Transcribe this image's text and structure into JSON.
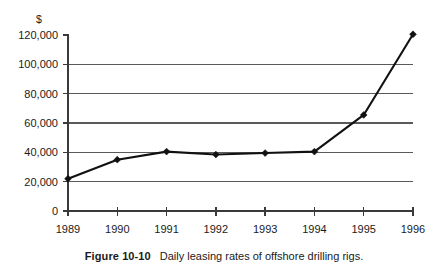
{
  "caption": {
    "number": "Figure 10-10",
    "text": "Daily leasing rates of offshore drilling rigs."
  },
  "chart_data": {
    "type": "line",
    "title": "",
    "xlabel": "",
    "ylabel": "",
    "unit_label": "$",
    "categories": [
      "1989",
      "1990",
      "1991",
      "1992",
      "1993",
      "1994",
      "1995",
      "1996"
    ],
    "values": [
      22000,
      35000,
      40500,
      38500,
      39500,
      40500,
      65500,
      120500
    ],
    "series": [
      {
        "name": "Daily leasing rate",
        "values": [
          22000,
          35000,
          40500,
          38500,
          39500,
          40500,
          65500,
          120500
        ]
      }
    ],
    "ylim": [
      0,
      120000
    ],
    "yticks": [
      0,
      20000,
      40000,
      60000,
      80000,
      100000,
      120000
    ],
    "ytick_labels": [
      "0",
      "20,000",
      "40,000",
      "60,000",
      "80,000",
      "100,000",
      "120,000"
    ],
    "gridline_values": [
      20000,
      40000,
      60000,
      80000,
      100000
    ],
    "grid": true,
    "legend": "none",
    "marker": "diamond",
    "line_color": "#111111",
    "grid_color": "#5a5a5a",
    "axis_color": "#3a3a3a",
    "background": "#ffffff"
  }
}
